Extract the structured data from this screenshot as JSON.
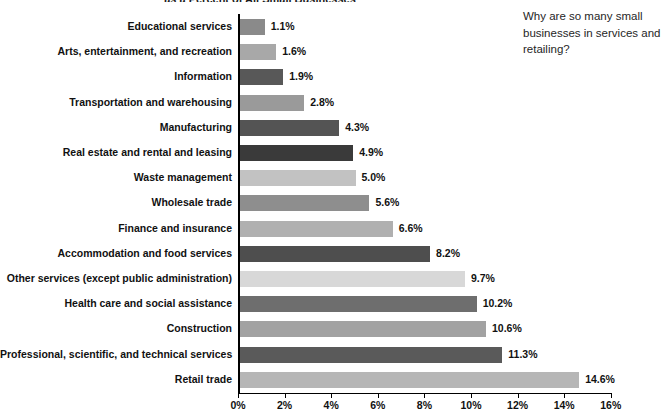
{
  "chart_data": {
    "type": "bar",
    "orientation": "horizontal",
    "title": "as a Percent of All Small Businesses",
    "xlabel": "",
    "ylabel": "",
    "xlim": [
      0,
      16
    ],
    "grid": false,
    "legend": null,
    "tick_labels": [
      "0%",
      "2%",
      "4%",
      "6%",
      "8%",
      "10%",
      "12%",
      "14%",
      "16%"
    ],
    "tick_values": [
      0,
      2,
      4,
      6,
      8,
      10,
      12,
      14,
      16
    ],
    "categories": [
      "Educational services",
      "Arts, entertainment, and recreation",
      "Information",
      "Transportation and warehousing",
      "Manufacturing",
      "Real estate and rental and leasing",
      "Waste management",
      "Wholesale trade",
      "Finance and insurance",
      "Accommodation and food services",
      "Other services (except public administration)",
      "Health care and social assistance",
      "Construction",
      "Professional, scientific, and technical services",
      "Retail trade"
    ],
    "values": [
      1.1,
      1.6,
      1.9,
      2.8,
      4.3,
      4.9,
      5.0,
      5.6,
      6.6,
      8.2,
      9.7,
      10.2,
      10.6,
      11.3,
      14.6
    ],
    "value_labels": [
      "1.1%",
      "1.6%",
      "1.9%",
      "2.8%",
      "4.3%",
      "4.9%",
      "5.0%",
      "5.6%",
      "6.6%",
      "8.2%",
      "9.7%",
      "10.2%",
      "10.6%",
      "11.3%",
      "14.6%"
    ],
    "bar_colors": [
      "#8a8a8a",
      "#a8a8a8",
      "#585858",
      "#9a9a9a",
      "#545454",
      "#3a3a3a",
      "#c2c2c2",
      "#8e8e8e",
      "#b0b0b0",
      "#4e4e4e",
      "#d8d8d8",
      "#6e6e6e",
      "#a2a2a2",
      "#5a5a5a",
      "#b6b6b6"
    ]
  },
  "margin_note": {
    "text": "Why are so many small businesses in services and retailing?"
  }
}
